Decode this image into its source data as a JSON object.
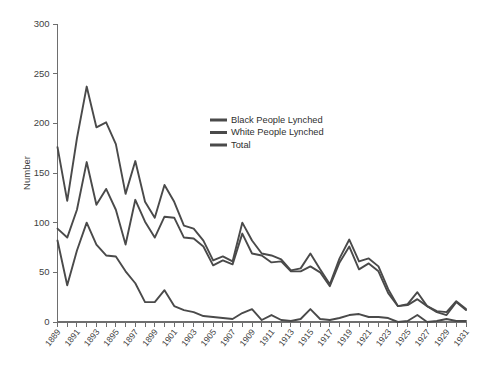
{
  "chart_data": {
    "type": "line",
    "title": "",
    "xlabel": "",
    "ylabel": "Number",
    "xlim": [
      1889,
      1931
    ],
    "ylim": [
      0,
      300
    ],
    "yticks": [
      0,
      50,
      100,
      150,
      200,
      250,
      300
    ],
    "grid": false,
    "legend_position": "upper-right-inside",
    "x": [
      1889,
      1890,
      1891,
      1892,
      1893,
      1894,
      1895,
      1896,
      1897,
      1898,
      1899,
      1900,
      1901,
      1902,
      1903,
      1904,
      1905,
      1906,
      1907,
      1908,
      1909,
      1910,
      1911,
      1912,
      1913,
      1914,
      1915,
      1916,
      1917,
      1918,
      1919,
      1920,
      1921,
      1922,
      1923,
      1924,
      1925,
      1926,
      1927,
      1928,
      1929,
      1930,
      1931
    ],
    "xtick_labels": [
      "1889",
      "1891",
      "1893",
      "1895",
      "1897",
      "1899",
      "1901",
      "1903",
      "1905",
      "1907",
      "1909",
      "1911",
      "1913",
      "1915",
      "1917",
      "1919",
      "1921",
      "1923",
      "1925",
      "1927",
      "1929",
      "1931"
    ],
    "series": [
      {
        "name": "Black People Lynched",
        "values": [
          94,
          85,
          113,
          161,
          118,
          134,
          113,
          78,
          123,
          101,
          85,
          106,
          105,
          85,
          84,
          76,
          57,
          62,
          58,
          89,
          69,
          67,
          60,
          61,
          51,
          51,
          56,
          50,
          36,
          60,
          76,
          53,
          59,
          51,
          29,
          16,
          17,
          23,
          16,
          10,
          7,
          20,
          12
        ]
      },
      {
        "name": "White People Lynched",
        "values": [
          82,
          37,
          72,
          100,
          78,
          67,
          66,
          51,
          39,
          20,
          20,
          32,
          16,
          12,
          10,
          6,
          5,
          4,
          3,
          9,
          13,
          2,
          7,
          2,
          1,
          3,
          13,
          3,
          2,
          4,
          7,
          8,
          5,
          5,
          4,
          0,
          1,
          7,
          0,
          1,
          3,
          1,
          1
        ]
      },
      {
        "name": "Total",
        "values": [
          176,
          122,
          185,
          237,
          196,
          201,
          179,
          129,
          162,
          121,
          105,
          138,
          121,
          97,
          94,
          82,
          62,
          66,
          61,
          100,
          82,
          69,
          67,
          63,
          52,
          54,
          69,
          53,
          38,
          64,
          83,
          61,
          64,
          56,
          33,
          16,
          18,
          30,
          16,
          11,
          10,
          21,
          13
        ]
      }
    ]
  },
  "legend": {
    "items": [
      {
        "label": "Black People Lynched",
        "color": "#4a4a4a"
      },
      {
        "label": "White People Lynched",
        "color": "#4a4a4a"
      },
      {
        "label": "Total",
        "color": "#4a4a4a"
      }
    ]
  },
  "colors": {
    "series": "#4a4a4a",
    "axis": "#6e6e6e",
    "text": "#3f3f3f",
    "background": "#ffffff"
  }
}
